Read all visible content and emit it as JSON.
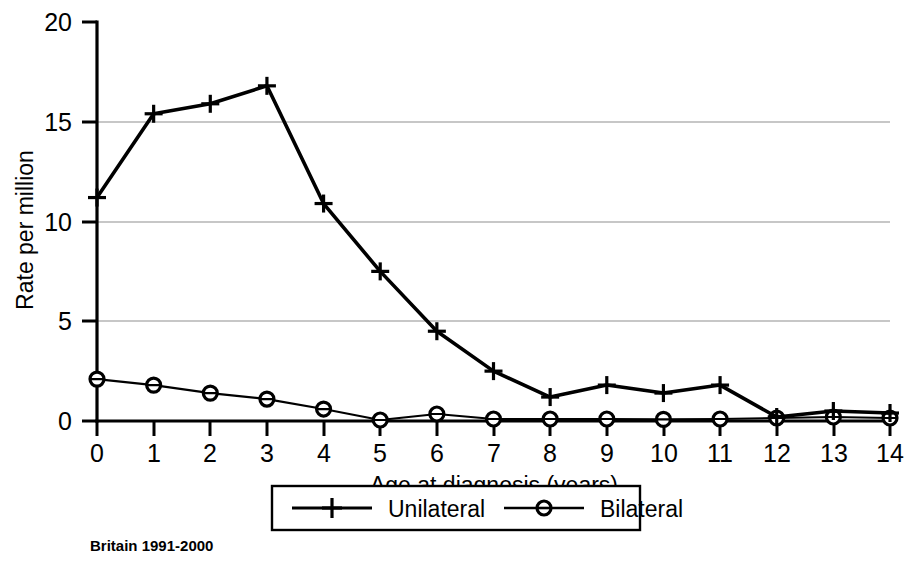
{
  "chart_data": {
    "type": "line",
    "title": "",
    "subtitle": "",
    "xlabel": "Age at diagnosis (years)",
    "ylabel": "Rate per million",
    "x": [
      0,
      1,
      2,
      3,
      4,
      5,
      6,
      7,
      8,
      9,
      10,
      11,
      12,
      13,
      14
    ],
    "xtick_labels": [
      "0",
      "1",
      "2",
      "3",
      "4",
      "5",
      "6",
      "7",
      "8",
      "9",
      "10",
      "11",
      "12",
      "13",
      "14"
    ],
    "ytick_labels": [
      "0",
      "5",
      "10",
      "15",
      "20"
    ],
    "yticks": [
      0,
      5,
      10,
      15,
      20
    ],
    "xlim": [
      0,
      14
    ],
    "ylim": [
      0,
      20
    ],
    "grid": "horizontal",
    "gridlines_at": [
      5,
      10,
      15
    ],
    "legend_position": "bottom-center",
    "series": [
      {
        "name": "Unilateral",
        "marker": "plus",
        "values": [
          11.2,
          15.4,
          15.9,
          16.8,
          10.9,
          7.5,
          4.5,
          2.5,
          1.2,
          1.8,
          1.4,
          1.8,
          0.2,
          0.5,
          0.4
        ]
      },
      {
        "name": "Bilateral",
        "marker": "circle",
        "values": [
          2.1,
          1.8,
          1.4,
          1.1,
          0.6,
          0.05,
          0.35,
          0.1,
          0.1,
          0.1,
          0.08,
          0.1,
          0.15,
          0.2,
          0.15
        ]
      }
    ],
    "annotation": "Britain 1991-2000",
    "colors": {
      "series_line": "#000000",
      "gridline": "#b5b5b5",
      "axis": "#000000",
      "background": "#ffffff"
    }
  },
  "legend": {
    "items": [
      {
        "label": "Unilateral",
        "marker": "plus-marker"
      },
      {
        "label": "Bilateral",
        "marker": "circle-marker"
      }
    ]
  },
  "caption": {
    "text": "Britain 1991-2000"
  }
}
